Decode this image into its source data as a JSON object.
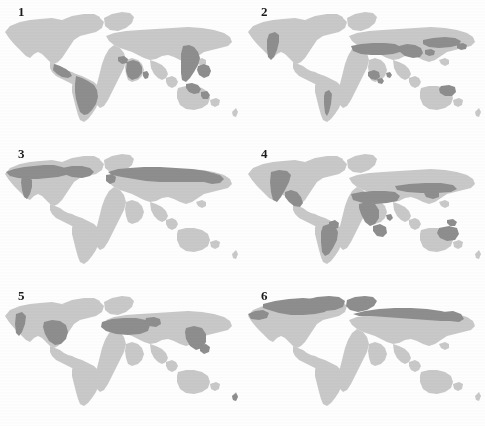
{
  "figure": {
    "type": "map-grid",
    "rows": 3,
    "columns": 2,
    "background_color": "#fefefe",
    "land_color": "#c9c9c9",
    "highlight_color": "#8e8e8e",
    "label_color": "#1b1b1b",
    "projection": "world-flat"
  },
  "panels": [
    {
      "label": "1",
      "name": "panel-tropical-rainforest",
      "biome": "Tropical rainforest",
      "position": {
        "row": 1,
        "column": 1,
        "x": 0,
        "y": 0,
        "width": 242,
        "height": 142
      },
      "highlighted_regions": [
        "Amazon Basin",
        "Central America",
        "Congo Basin",
        "West Africa",
        "Madagascar east coast",
        "Southeast Asia",
        "Indonesia",
        "New Guinea",
        "Northeast Australia",
        "Western India"
      ]
    },
    {
      "label": "2",
      "name": "panel-desert",
      "biome": "Desert",
      "position": {
        "row": 1,
        "column": 2,
        "x": 243,
        "y": 0,
        "width": 242,
        "height": 142
      },
      "highlighted_regions": [
        "Sahara",
        "Arabian Peninsula",
        "Iran and Central Asia",
        "Gobi and Taklamakan",
        "Thar Desert",
        "Kalahari and Namib",
        "Australian Interior",
        "Atacama",
        "Patagonia",
        "Southwest North America"
      ]
    },
    {
      "label": "3",
      "name": "panel-boreal-forest",
      "biome": "Boreal forest (taiga)",
      "position": {
        "row": 2,
        "column": 1,
        "x": 0,
        "y": 142,
        "width": 242,
        "height": 142
      },
      "highlighted_regions": [
        "Alaska",
        "Canada",
        "Scandinavia",
        "European Russia",
        "Siberia",
        "Russian Far East"
      ]
    },
    {
      "label": "4",
      "name": "panel-grassland-savanna",
      "biome": "Grassland and savanna",
      "position": {
        "row": 2,
        "column": 2,
        "x": 243,
        "y": 142,
        "width": 242,
        "height": 142
      },
      "highlighted_regions": [
        "Great Plains",
        "Cerrado and Llanos",
        "Pampas",
        "Sahel",
        "East Africa",
        "Southern Africa",
        "Eurasian Steppe",
        "Northern Australia",
        "Eastern Australia"
      ]
    },
    {
      "label": "5",
      "name": "panel-temperate-deciduous-forest",
      "biome": "Temperate deciduous forest",
      "position": {
        "row": 3,
        "column": 1,
        "x": 0,
        "y": 284,
        "width": 242,
        "height": 142
      },
      "highlighted_regions": [
        "Eastern North America",
        "Pacific Northwest",
        "Western and Central Europe",
        "Eastern China",
        "Korea and Japan",
        "New Zealand"
      ]
    },
    {
      "label": "6",
      "name": "panel-tundra",
      "biome": "Tundra",
      "position": {
        "row": 3,
        "column": 2,
        "x": 243,
        "y": 284,
        "width": 242,
        "height": 142
      },
      "highlighted_regions": [
        "Arctic Canada",
        "Greenland",
        "Alaskan North Slope",
        "Iceland",
        "Northern Scandinavia",
        "Northern Siberia"
      ]
    }
  ]
}
